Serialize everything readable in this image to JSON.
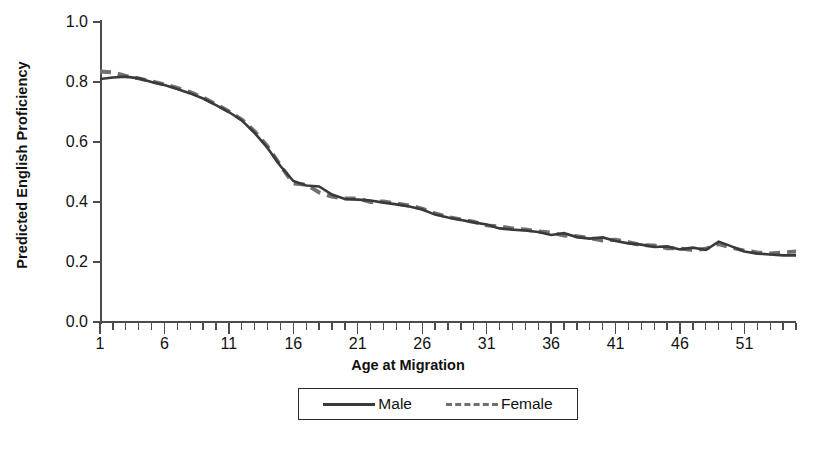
{
  "chart_data": {
    "type": "line",
    "title": "",
    "xlabel": "Age at Migration",
    "ylabel": "Predicted English Proficiency",
    "xlim": [
      1,
      55
    ],
    "ylim": [
      0.0,
      1.0
    ],
    "grid": false,
    "legend_position": "bottom-center",
    "x_tick_labels": [
      "1",
      "6",
      "11",
      "16",
      "21",
      "26",
      "31",
      "36",
      "41",
      "46",
      "51"
    ],
    "x_tick_values": [
      1,
      6,
      11,
      16,
      21,
      26,
      31,
      36,
      41,
      46,
      51
    ],
    "x_minor_tick_step": 1,
    "y_tick_labels": [
      "0.0",
      "0.2",
      "0.4",
      "0.6",
      "0.8",
      "1.0"
    ],
    "y_tick_values": [
      0.0,
      0.2,
      0.4,
      0.6,
      0.8,
      1.0
    ],
    "x": [
      1,
      2,
      3,
      4,
      5,
      6,
      7,
      8,
      9,
      10,
      11,
      12,
      13,
      14,
      15,
      16,
      17,
      18,
      19,
      20,
      21,
      22,
      23,
      24,
      25,
      26,
      27,
      28,
      29,
      30,
      31,
      32,
      33,
      34,
      35,
      36,
      37,
      38,
      39,
      40,
      41,
      42,
      43,
      44,
      45,
      46,
      47,
      48,
      49,
      50,
      51,
      52,
      53,
      54,
      55
    ],
    "series": [
      {
        "name": "Male",
        "style": "solid",
        "color": "#3a3a3a",
        "values": [
          0.81,
          0.815,
          0.818,
          0.812,
          0.8,
          0.79,
          0.777,
          0.762,
          0.745,
          0.723,
          0.7,
          0.672,
          0.63,
          0.58,
          0.52,
          0.47,
          0.455,
          0.452,
          0.425,
          0.41,
          0.408,
          0.405,
          0.398,
          0.392,
          0.385,
          0.375,
          0.358,
          0.348,
          0.34,
          0.332,
          0.325,
          0.312,
          0.308,
          0.305,
          0.3,
          0.29,
          0.296,
          0.283,
          0.278,
          0.282,
          0.27,
          0.262,
          0.258,
          0.25,
          0.252,
          0.242,
          0.248,
          0.24,
          0.268,
          0.252,
          0.235,
          0.228,
          0.225,
          0.222,
          0.222
        ]
      },
      {
        "name": "Female",
        "style": "dashed",
        "color": "#707070",
        "values": [
          0.835,
          0.832,
          0.82,
          0.812,
          0.802,
          0.792,
          0.78,
          0.766,
          0.748,
          0.726,
          0.702,
          0.675,
          0.635,
          0.585,
          0.522,
          0.462,
          0.458,
          0.432,
          0.418,
          0.412,
          0.412,
          0.4,
          0.402,
          0.395,
          0.388,
          0.378,
          0.362,
          0.35,
          0.342,
          0.334,
          0.322,
          0.318,
          0.312,
          0.308,
          0.302,
          0.298,
          0.288,
          0.286,
          0.28,
          0.272,
          0.274,
          0.266,
          0.256,
          0.255,
          0.246,
          0.245,
          0.24,
          0.244,
          0.26,
          0.248,
          0.238,
          0.232,
          0.228,
          0.232,
          0.235
        ]
      }
    ],
    "legend": [
      {
        "label": "Male",
        "style": "solid"
      },
      {
        "label": "Female",
        "style": "dashed"
      }
    ]
  }
}
